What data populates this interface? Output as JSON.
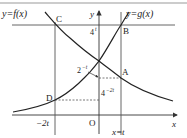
{
  "figure": {
    "type": "function-graph",
    "functions": {
      "f": {
        "label": "y=f(x)",
        "description": "decreasing exponential curve"
      },
      "g": {
        "label": "y=g(x)",
        "description": "increasing exponential curve"
      }
    },
    "axes": {
      "x_label": "x",
      "y_label": "y",
      "origin_label": "O"
    },
    "points": {
      "A": "A",
      "B": "B",
      "C": "C",
      "D": "D"
    },
    "annotations": {
      "level_4t": {
        "base": "4",
        "exp": "t"
      },
      "level_2mt": {
        "base": "2",
        "exp": "−t"
      },
      "level_4m2t": {
        "base": "4",
        "exp": "−2t"
      },
      "x_minus2t": "−2t",
      "x_eq_t": "x=t"
    }
  },
  "colors": {
    "stroke": "#333333",
    "grid": "#555555",
    "background": "#ffffff"
  }
}
